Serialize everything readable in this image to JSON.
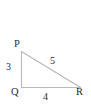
{
  "figure": {
    "kind": "right-triangle-diagram",
    "background_color": "#ffffff",
    "stroke_color": "#b9b9b9",
    "text_color": "#2b2b2b",
    "vertices": {
      "P": {
        "label": "P",
        "x": 21,
        "y": 51
      },
      "Q": {
        "label": "Q",
        "x": 21,
        "y": 87
      },
      "R": {
        "label": "R",
        "x": 80,
        "y": 87
      }
    },
    "sides": {
      "PQ": {
        "label": "3",
        "description": "vertical leg"
      },
      "QR": {
        "label": "4",
        "description": "horizontal leg"
      },
      "PR": {
        "label": "5",
        "description": "hypotenuse"
      }
    }
  }
}
